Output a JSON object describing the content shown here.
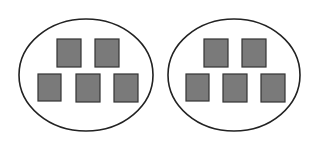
{
  "diagram": {
    "colors": {
      "square_fill": "#7a7a7a",
      "square_stroke": "#333333",
      "oval_stroke": "#222222",
      "background": "#ffffff"
    },
    "groups": [
      {
        "label": "group-1",
        "count": 5,
        "oval": {
          "cx": 86,
          "cy": 75,
          "rx": 67,
          "ry": 56
        },
        "squares": [
          {
            "x": 57,
            "y": 39,
            "w": 24,
            "h": 28
          },
          {
            "x": 95,
            "y": 39,
            "w": 24,
            "h": 28
          },
          {
            "x": 38,
            "y": 74,
            "w": 23,
            "h": 27
          },
          {
            "x": 76,
            "y": 74,
            "w": 24,
            "h": 28
          },
          {
            "x": 114,
            "y": 74,
            "w": 24,
            "h": 28
          }
        ]
      },
      {
        "label": "group-2",
        "count": 5,
        "oval": {
          "cx": 234,
          "cy": 75,
          "rx": 66,
          "ry": 56
        },
        "squares": [
          {
            "x": 204,
            "y": 39,
            "w": 24,
            "h": 28
          },
          {
            "x": 242,
            "y": 39,
            "w": 24,
            "h": 28
          },
          {
            "x": 186,
            "y": 74,
            "w": 23,
            "h": 27
          },
          {
            "x": 223,
            "y": 74,
            "w": 24,
            "h": 28
          },
          {
            "x": 261,
            "y": 74,
            "w": 24,
            "h": 28
          }
        ]
      }
    ]
  }
}
